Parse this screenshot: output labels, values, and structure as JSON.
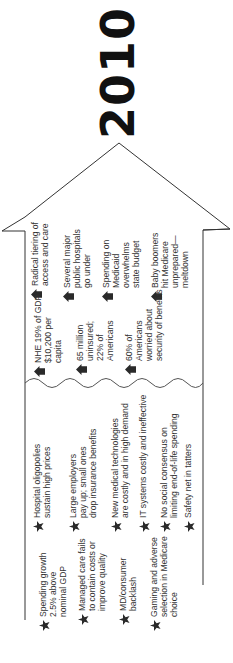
{
  "year": "2010",
  "colors": {
    "line": "#333333",
    "icon": "#2a2a2a",
    "text": "#333333"
  },
  "future": {
    "icon": "house-arrow-icon",
    "items": [
      {
        "text": "Radical tiering of\naccess and care"
      },
      {
        "text": "Several major\npublic hospitals\ngo under"
      },
      {
        "text": "Spending on\nMedicaid\noverwhelms\nstate budget"
      },
      {
        "text": "Baby boomers\nhit Medicare\nunprepared—\nmeltdown"
      }
    ]
  },
  "metrics": {
    "icon": "house-arrow-icon",
    "items": [
      {
        "text": "NHE 19% of GDP\n$10,200 per\ncapita"
      },
      {
        "text": "65 million\nuninsured;\n22% of\nAmericans"
      },
      {
        "text": "60% of\nAmericans\nworried about\nsecurity of benefits"
      }
    ]
  },
  "drivers_right": {
    "icon": "star-icon",
    "items": [
      {
        "text": "Hospital oligopolies\nsustain high prices"
      },
      {
        "text": "Large employers\npay up; small ones\ndrop insurance benefits"
      },
      {
        "text": "New medical technologies\nare costly and in high demand"
      },
      {
        "text": "IT systems costly and ineffective"
      },
      {
        "text": "No social consensus on\nlimiting end-of-life spending"
      },
      {
        "text": "Safety net in tatters"
      }
    ]
  },
  "drivers_left": {
    "icon": "star-icon",
    "items": [
      {
        "text": "Spending growth\n2.5% above\nnominal GDP"
      },
      {
        "text": "Managed care fails\nto contain costs or\nimprove quality"
      },
      {
        "text": "MD/consumer\nbacklash"
      },
      {
        "text": "Gaming and adverse\nselection in Medicare\nchoice"
      }
    ]
  }
}
